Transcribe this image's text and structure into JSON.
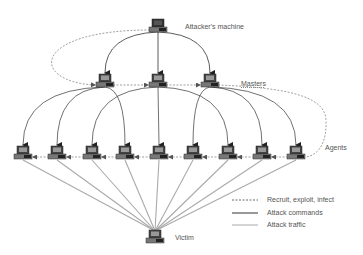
{
  "diagram": {
    "type": "ddos-attack-architecture",
    "labels": {
      "attacker": "Attacker's machine",
      "masters": "Masters",
      "agents": "Agents",
      "victim": "Victim"
    },
    "nodes": {
      "attacker": {
        "x": 158,
        "y": 26
      },
      "masters": [
        {
          "x": 105,
          "y": 81
        },
        {
          "x": 158,
          "y": 81
        },
        {
          "x": 210,
          "y": 81
        }
      ],
      "agents": [
        {
          "x": 23,
          "y": 153
        },
        {
          "x": 57,
          "y": 153
        },
        {
          "x": 92,
          "y": 153
        },
        {
          "x": 125,
          "y": 153
        },
        {
          "x": 159,
          "y": 153
        },
        {
          "x": 193,
          "y": 153
        },
        {
          "x": 228,
          "y": 153
        },
        {
          "x": 262,
          "y": 153
        },
        {
          "x": 296,
          "y": 153
        }
      ],
      "victim": {
        "x": 155,
        "y": 237
      }
    },
    "legend": [
      {
        "label": "Recruit, exploit, infect",
        "style": "dashed",
        "color": "#666666"
      },
      {
        "label": "Attack commands",
        "style": "solid",
        "color": "#333333"
      },
      {
        "label": "Attack traffic",
        "style": "solid",
        "color": "#aaaaaa"
      }
    ],
    "colors": {
      "command_line": "#333333",
      "traffic_line": "#aaaaaa",
      "recruit_line": "#777777",
      "computer_dark": "#444444",
      "computer_screen": "#999999"
    }
  }
}
